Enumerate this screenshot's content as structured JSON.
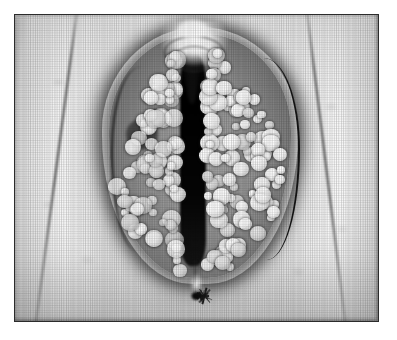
{
  "page": {
    "background_color": "#ffffff",
    "width_px": 397,
    "height_px": 340,
    "caption": "",
    "has_text": false
  },
  "figure": {
    "kind": "clinical-photograph",
    "rendering": "black-and-white halftone print (screened scan)",
    "frame": {
      "border_color": "#2b2b2b",
      "border_width_px": 1.4,
      "inset_left_px": 14,
      "inset_top_px": 14,
      "content_width_px": 365,
      "content_height_px": 308
    },
    "orientation": "frontal, symmetric, midline vertical",
    "palette": {
      "highlight": "#ffffff",
      "skin_light": "#ededed",
      "skin_mid": "#c6c6c6",
      "skin_shadow": "#8f8f8f",
      "outline": "#1a1a1a",
      "cleft_black": "#000000"
    },
    "features": [
      {
        "name": "left-inguinal-crease",
        "description": "dark diagonal skin fold on left thigh"
      },
      {
        "name": "right-inguinal-crease",
        "description": "dark diagonal skin fold on right thigh"
      },
      {
        "name": "lesion-mass",
        "description": "ovoid cluster of confluent bright papules occupying the midline"
      },
      {
        "name": "central-cleft",
        "description": "near-black vertical midline cleft"
      },
      {
        "name": "anterior-hood",
        "description": "bright folded tissue with concentric ridges at superior margin"
      },
      {
        "name": "left-lobe-recess",
        "description": "shadowed depression within the left lesion lobe"
      },
      {
        "name": "perineal-star",
        "description": "dark radiating star-shaped structure at inferior midline"
      }
    ],
    "texture": {
      "halftone_dot_pitch_px": 2.4,
      "scanline_pitch_px": 2.2,
      "grain": "coarse stippled skin mottling"
    }
  }
}
